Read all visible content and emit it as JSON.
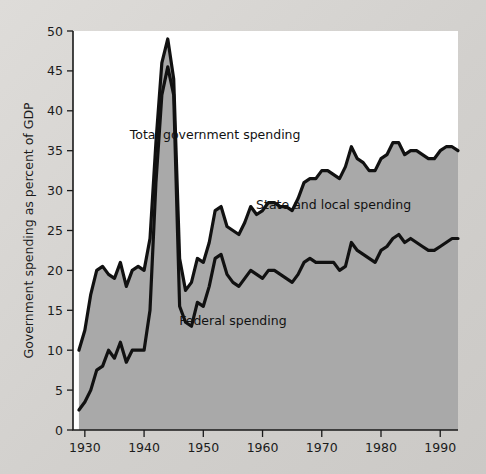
{
  "chart_data": {
    "type": "area",
    "title": "",
    "xlabel": "",
    "ylabel": "Government spending as percent of GDP",
    "xlim": [
      1928,
      1993
    ],
    "ylim": [
      0,
      50
    ],
    "grid": false,
    "legend_position": "in-plot annotations",
    "x_ticks": [
      1930,
      1940,
      1950,
      1960,
      1970,
      1980,
      1990
    ],
    "x_tick_labels": [
      "1930",
      "1940",
      "1950",
      "1960",
      "1970",
      "1980",
      "1990"
    ],
    "y_ticks": [
      0,
      5,
      10,
      15,
      20,
      25,
      30,
      35,
      40,
      45,
      50
    ],
    "y_tick_labels": [
      "0",
      "5",
      "10",
      "15",
      "20",
      "25",
      "30",
      "35",
      "40",
      "45",
      "50"
    ],
    "annotations": [
      {
        "text": "Total government spending",
        "x": 1952,
        "y": 36.5
      },
      {
        "text": "State and local spending",
        "x": 1972,
        "y": 27.7
      },
      {
        "text": "Federal spending",
        "x": 1955,
        "y": 13.2
      }
    ],
    "colors": {
      "area_fill": "#a9a9a9",
      "line": "#111111",
      "plot_background": "#ffffff",
      "figure_background": "#d6d4d1",
      "text": "#1b1b1b"
    },
    "x": [
      1929,
      1930,
      1931,
      1932,
      1933,
      1934,
      1935,
      1936,
      1937,
      1938,
      1939,
      1940,
      1941,
      1942,
      1943,
      1944,
      1945,
      1946,
      1947,
      1948,
      1949,
      1950,
      1951,
      1952,
      1953,
      1954,
      1955,
      1956,
      1957,
      1958,
      1959,
      1960,
      1961,
      1962,
      1963,
      1964,
      1965,
      1966,
      1967,
      1968,
      1969,
      1970,
      1971,
      1972,
      1973,
      1974,
      1975,
      1976,
      1977,
      1978,
      1979,
      1980,
      1981,
      1982,
      1983,
      1984,
      1985,
      1986,
      1987,
      1988,
      1989,
      1990,
      1991,
      1992,
      1993
    ],
    "series": [
      {
        "name": "Total government spending",
        "values": [
          10.0,
          12.5,
          17.0,
          20.0,
          20.5,
          19.5,
          19.0,
          21.0,
          18.0,
          20.0,
          20.5,
          20.0,
          24.0,
          36.0,
          46.0,
          49.0,
          44.0,
          21.5,
          17.5,
          18.5,
          21.5,
          21.0,
          23.5,
          27.5,
          28.0,
          25.5,
          25.0,
          24.5,
          26.0,
          28.0,
          27.0,
          27.5,
          28.5,
          28.5,
          28.0,
          28.0,
          27.5,
          29.0,
          31.0,
          31.5,
          31.5,
          32.5,
          32.5,
          32.0,
          31.5,
          33.0,
          35.5,
          34.0,
          33.5,
          32.5,
          32.5,
          34.0,
          34.5,
          36.0,
          36.0,
          34.5,
          35.0,
          35.0,
          34.5,
          34.0,
          34.0,
          35.0,
          35.5,
          35.5,
          35.0
        ]
      },
      {
        "name": "Federal spending",
        "values": [
          2.5,
          3.5,
          5.0,
          7.5,
          8.0,
          10.0,
          9.0,
          11.0,
          8.5,
          10.0,
          10.0,
          10.0,
          15.0,
          31.0,
          42.0,
          45.5,
          42.0,
          15.5,
          13.5,
          13.0,
          16.0,
          15.5,
          18.0,
          21.5,
          22.0,
          19.5,
          18.5,
          18.0,
          19.0,
          20.0,
          19.5,
          19.0,
          20.0,
          20.0,
          19.5,
          19.0,
          18.5,
          19.5,
          21.0,
          21.5,
          21.0,
          21.0,
          21.0,
          21.0,
          20.0,
          20.5,
          23.5,
          22.5,
          22.0,
          21.5,
          21.0,
          22.5,
          23.0,
          24.0,
          24.5,
          23.5,
          24.0,
          23.5,
          23.0,
          22.5,
          22.5,
          23.0,
          23.5,
          24.0,
          24.0
        ]
      }
    ]
  },
  "figure": {
    "plot_area": {
      "left": 73,
      "top": 31,
      "right": 458,
      "bottom": 430
    }
  }
}
